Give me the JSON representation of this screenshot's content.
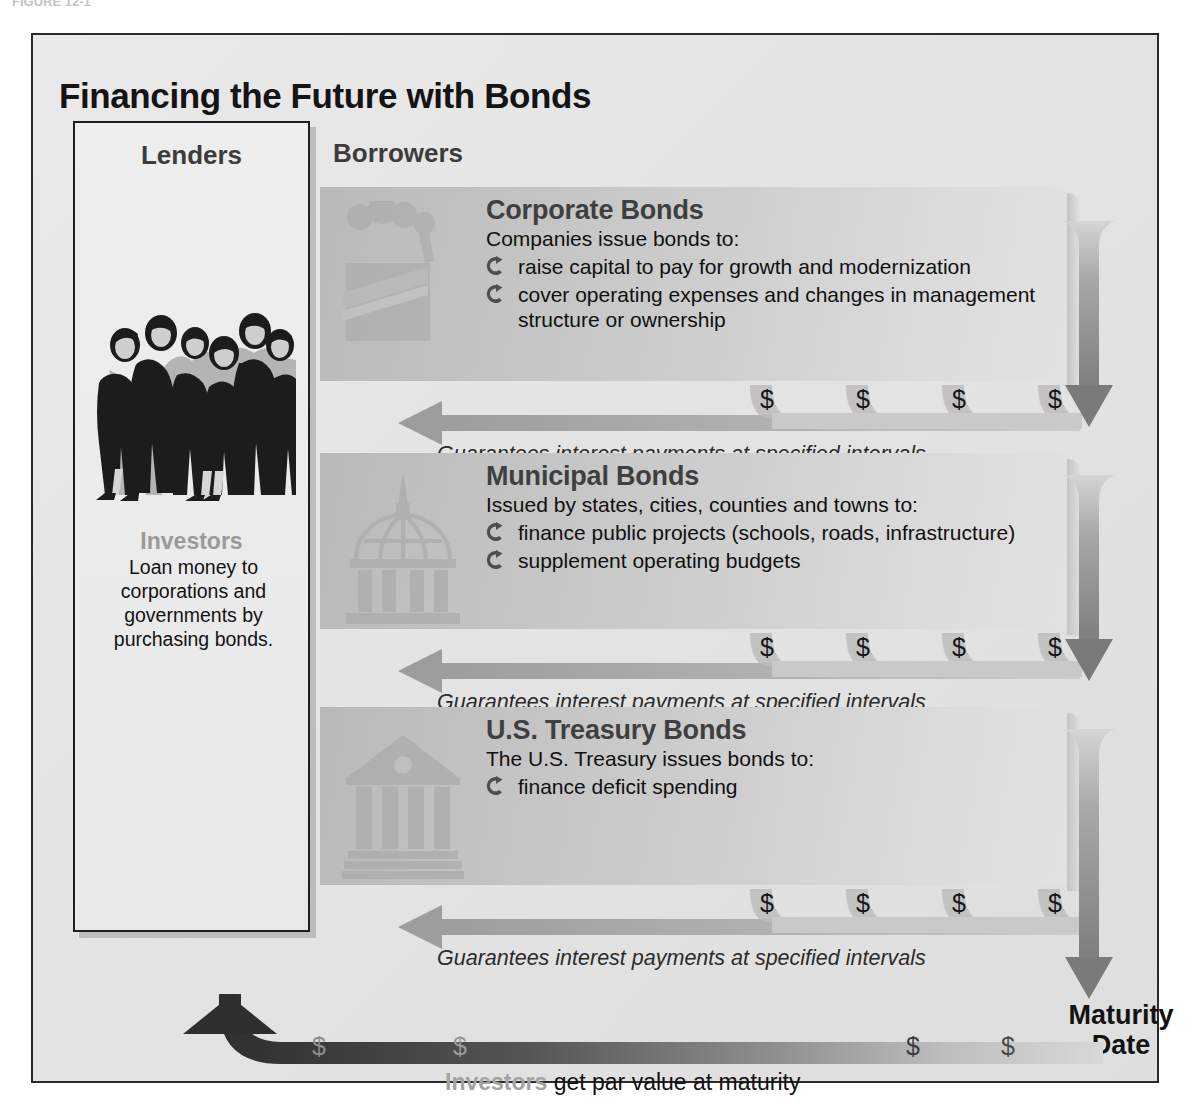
{
  "figure": {
    "title": "Financing the Future with Bonds",
    "top_fragment": "FIGURE 12-1"
  },
  "lenders": {
    "heading": "Lenders",
    "figure_icon": "group-of-investors-icon",
    "label": "Investors",
    "description": "Loan money to corporations and governments by purchasing bonds."
  },
  "borrowers": {
    "heading": "Borrowers",
    "sections": [
      {
        "id": "corporate",
        "icon": "factory-icon",
        "title": "Corporate Bonds",
        "subtitle": "Companies issue bonds to:",
        "bullets": [
          "raise capital to pay for growth and modernization",
          "cover operating expenses and changes in management structure or ownership"
        ],
        "interest_caption": "Guarantees interest payments at specified intervals",
        "dollar_symbol": "$",
        "dollar_count": 4
      },
      {
        "id": "municipal",
        "icon": "capitol-dome-icon",
        "title": "Municipal Bonds",
        "subtitle": "Issued by states, cities, counties and towns to:",
        "bullets": [
          "finance public projects (schools, roads, infrastructure)",
          "supplement operating budgets"
        ],
        "interest_caption": "Guarantees interest payments at specified intervals",
        "dollar_symbol": "$",
        "dollar_count": 4
      },
      {
        "id": "treasury",
        "icon": "treasury-building-icon",
        "title": "U.S. Treasury Bonds",
        "subtitle": "The U.S. Treasury issues bonds to:",
        "bullets": [
          "finance deficit spending"
        ],
        "interest_caption": "Guarantees interest payments at specified intervals",
        "dollar_symbol": "$",
        "dollar_count": 4
      }
    ]
  },
  "maturity": {
    "label_line1": "Maturity",
    "label_line2": "Date",
    "arrow_icon": "down-arrow-icon"
  },
  "par_value": {
    "arrow_icon": "up-left-return-arrow-icon",
    "strong_label": "Investors",
    "caption": " get par value at maturity",
    "dollar_symbol": "$",
    "dollar_count": 4
  },
  "colors": {
    "frame_border": "#2a2a2a",
    "panel_gray": "#c6c6c6",
    "accent_gray": "#8f8f8f",
    "dark_arrow": "#3a3a3a",
    "text": "#121212"
  }
}
